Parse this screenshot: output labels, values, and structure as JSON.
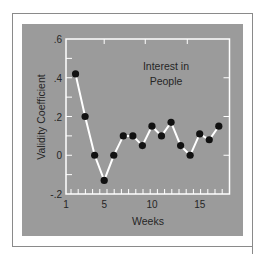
{
  "chart_data": {
    "type": "line",
    "title": "Interest in People",
    "title_lines": [
      "Interest in",
      "People"
    ],
    "xlabel": "Weeks",
    "ylabel": "Validity Coefficient",
    "xlim": [
      1,
      18
    ],
    "ylim": [
      -0.2,
      0.6
    ],
    "x_ticks": [
      1,
      5,
      10,
      15
    ],
    "x_tick_labels": [
      "1",
      "5",
      "10",
      "15"
    ],
    "y_ticks": [
      0.6,
      0.4,
      0.2,
      0,
      -0.2
    ],
    "y_tick_labels": [
      ".6",
      ".4",
      ".2",
      "0",
      "-.2"
    ],
    "grid": false,
    "legend": null,
    "series": [
      {
        "name": "Interest in People",
        "x": [
          2,
          3,
          4,
          5,
          6,
          7,
          8,
          9,
          10,
          11,
          12,
          13,
          14,
          15,
          16,
          17
        ],
        "values": [
          0.42,
          0.2,
          0.0,
          -0.13,
          0.0,
          0.1,
          0.1,
          0.05,
          0.15,
          0.1,
          0.17,
          0.05,
          0.0,
          0.11,
          0.08,
          0.15
        ]
      }
    ],
    "colors": {
      "background": "#9b9b9b",
      "axes": "#ffffff",
      "line": "#ffffff",
      "markers": "#111111",
      "text": "#262626"
    }
  }
}
